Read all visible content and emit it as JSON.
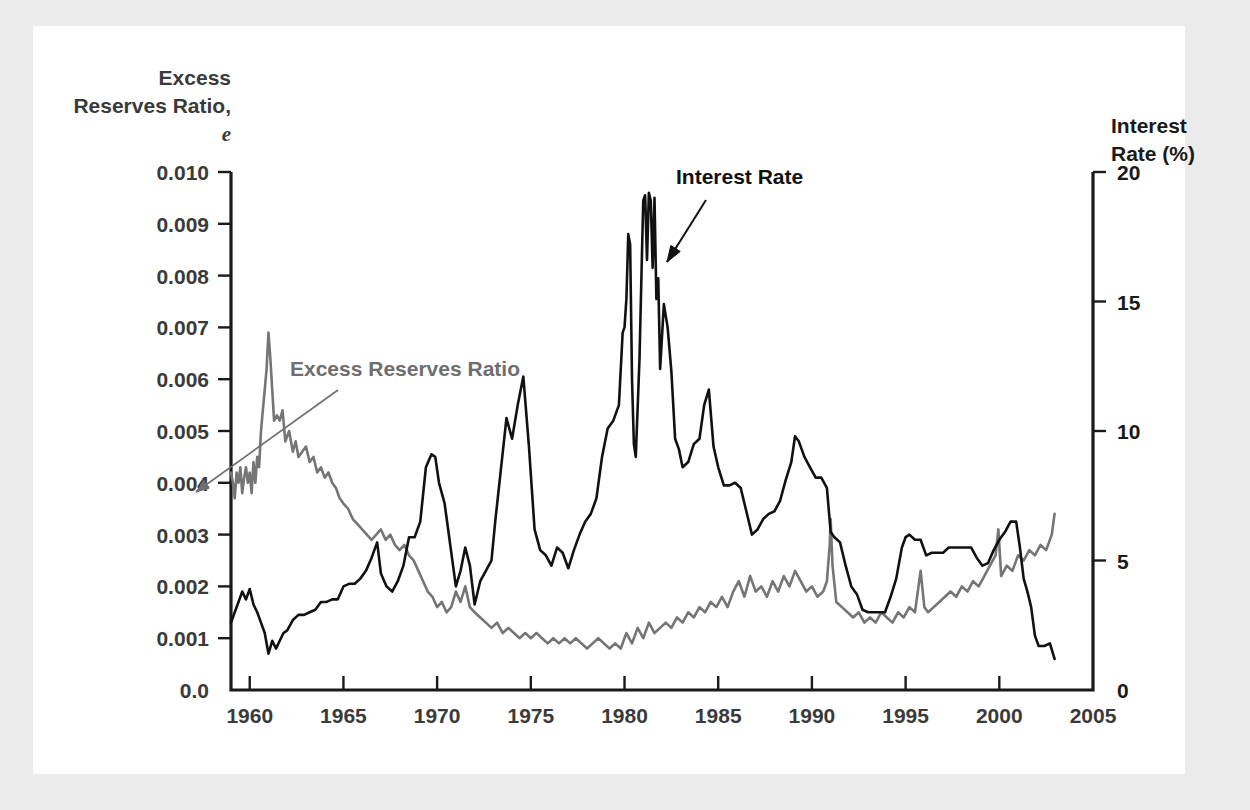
{
  "figure": {
    "background_color": "#ebebeb",
    "panel_color": "#ffffff"
  },
  "chart_data": {
    "type": "line",
    "title": "",
    "subtitle": "",
    "xlabel": "",
    "ylabel": "Excess Reserves Ratio, e",
    "ylabel_line1": "Excess",
    "ylabel_line2": "Reserves Ratio,",
    "ylabel_line3_italic": "e",
    "y2label": "Interest Rate (%)",
    "y2label_line1": "Interest",
    "y2label_line2": "Rate (%)",
    "grid": false,
    "legend_position": "inline-annotations",
    "xlim": [
      1959,
      2005
    ],
    "ylim": [
      0.0,
      0.01
    ],
    "y2lim": [
      0,
      20
    ],
    "xticks": [
      1960,
      1965,
      1970,
      1975,
      1980,
      1985,
      1990,
      1995,
      2000,
      2005
    ],
    "xtick_labels": [
      "1960",
      "1965",
      "1970",
      "1975",
      "1980",
      "1985",
      "1990",
      "1995",
      "2000",
      "2005"
    ],
    "yticks": [
      0.0,
      0.001,
      0.002,
      0.003,
      0.004,
      0.005,
      0.006,
      0.007,
      0.008,
      0.009,
      0.01
    ],
    "ytick_labels": [
      "0.0",
      "0.001",
      "0.002",
      "0.003",
      "0.004",
      "0.005",
      "0.006",
      "0.007",
      "0.008",
      "0.009",
      "0.010"
    ],
    "y2ticks": [
      0,
      5,
      10,
      15,
      20
    ],
    "y2tick_labels": [
      "0",
      "5",
      "10",
      "15",
      "20"
    ],
    "annotations": [
      {
        "text": "Excess Reserves Ratio",
        "color": "#6e6e6e",
        "text_x": 290,
        "text_y": 376,
        "arrow_from": [
          338,
          390
        ],
        "arrow_to": [
          196,
          492
        ]
      },
      {
        "text": "Interest Rate",
        "color": "#111111",
        "text_x": 676,
        "text_y": 184,
        "arrow_from": [
          706,
          200
        ],
        "arrow_to": [
          667,
          262
        ]
      }
    ],
    "series": [
      {
        "name": "Excess Reserves Ratio",
        "axis": "left",
        "color": "#757575",
        "x": [
          1959.0,
          1959.1,
          1959.2,
          1959.3,
          1959.4,
          1959.5,
          1959.6,
          1959.7,
          1959.8,
          1959.9,
          1960.0,
          1960.1,
          1960.2,
          1960.3,
          1960.4,
          1960.5,
          1960.6,
          1960.75,
          1960.9,
          1961.0,
          1961.1,
          1961.2,
          1961.3,
          1961.45,
          1961.6,
          1961.75,
          1961.9,
          1962.1,
          1962.3,
          1962.45,
          1962.6,
          1962.8,
          1963.0,
          1963.2,
          1963.4,
          1963.6,
          1963.8,
          1964.0,
          1964.2,
          1964.4,
          1964.6,
          1964.8,
          1965.0,
          1965.25,
          1965.5,
          1965.75,
          1966.0,
          1966.25,
          1966.5,
          1966.75,
          1967.0,
          1967.25,
          1967.5,
          1967.75,
          1968.0,
          1968.25,
          1968.5,
          1968.75,
          1969.0,
          1969.25,
          1969.5,
          1969.75,
          1970.0,
          1970.25,
          1970.5,
          1970.75,
          1971.0,
          1971.25,
          1971.5,
          1971.75,
          1972.0,
          1972.3,
          1972.6,
          1972.9,
          1973.2,
          1973.5,
          1973.8,
          1974.1,
          1974.4,
          1974.7,
          1975.0,
          1975.3,
          1975.6,
          1975.9,
          1976.2,
          1976.5,
          1976.8,
          1977.1,
          1977.4,
          1977.7,
          1978.0,
          1978.3,
          1978.6,
          1978.9,
          1979.2,
          1979.5,
          1979.8,
          1980.1,
          1980.4,
          1980.7,
          1981.0,
          1981.3,
          1981.6,
          1981.9,
          1982.2,
          1982.5,
          1982.8,
          1983.1,
          1983.4,
          1983.7,
          1984.0,
          1984.3,
          1984.6,
          1984.9,
          1985.2,
          1985.5,
          1985.8,
          1986.1,
          1986.4,
          1986.7,
          1987.0,
          1987.3,
          1987.6,
          1987.9,
          1988.2,
          1988.5,
          1988.8,
          1989.1,
          1989.4,
          1989.7,
          1990.0,
          1990.3,
          1990.6,
          1990.8,
          1990.95,
          1991.0,
          1991.1,
          1991.3,
          1991.6,
          1991.9,
          1992.2,
          1992.5,
          1992.8,
          1993.1,
          1993.4,
          1993.7,
          1994.0,
          1994.3,
          1994.6,
          1994.9,
          1995.2,
          1995.5,
          1995.8,
          1996.0,
          1996.2,
          1996.5,
          1996.8,
          1997.1,
          1997.4,
          1997.7,
          1998.0,
          1998.3,
          1998.6,
          1998.9,
          1999.2,
          1999.5,
          1999.8,
          1999.95,
          2000.1,
          2000.4,
          2000.7,
          2001.0,
          2001.3,
          2001.6,
          2001.9,
          2002.2,
          2002.5,
          2002.8,
          2002.95
        ],
        "y": [
          0.0042,
          0.004,
          0.0037,
          0.0042,
          0.004,
          0.0043,
          0.0038,
          0.0041,
          0.0043,
          0.004,
          0.0042,
          0.0038,
          0.0044,
          0.004,
          0.0045,
          0.0043,
          0.005,
          0.0056,
          0.0062,
          0.0069,
          0.0064,
          0.0058,
          0.0052,
          0.0053,
          0.0052,
          0.0054,
          0.0048,
          0.005,
          0.0046,
          0.0048,
          0.0045,
          0.0046,
          0.0047,
          0.0044,
          0.0045,
          0.0042,
          0.0043,
          0.0041,
          0.0042,
          0.004,
          0.0039,
          0.0037,
          0.0036,
          0.0035,
          0.0033,
          0.0032,
          0.0031,
          0.003,
          0.0029,
          0.003,
          0.0031,
          0.0029,
          0.003,
          0.0028,
          0.0027,
          0.0028,
          0.0026,
          0.0025,
          0.0023,
          0.0021,
          0.0019,
          0.0018,
          0.0016,
          0.0017,
          0.0015,
          0.0016,
          0.0019,
          0.0017,
          0.002,
          0.0016,
          0.0015,
          0.0014,
          0.0013,
          0.0012,
          0.0013,
          0.0011,
          0.0012,
          0.0011,
          0.001,
          0.0011,
          0.001,
          0.0011,
          0.001,
          0.0009,
          0.001,
          0.0009,
          0.001,
          0.0009,
          0.001,
          0.0009,
          0.0008,
          0.0009,
          0.001,
          0.0009,
          0.0008,
          0.0009,
          0.0008,
          0.0011,
          0.0009,
          0.0012,
          0.001,
          0.0013,
          0.0011,
          0.0012,
          0.0013,
          0.0012,
          0.0014,
          0.0013,
          0.0015,
          0.0014,
          0.0016,
          0.0015,
          0.0017,
          0.0016,
          0.0018,
          0.0016,
          0.0019,
          0.0021,
          0.0018,
          0.0022,
          0.0019,
          0.002,
          0.0018,
          0.0021,
          0.0019,
          0.0022,
          0.002,
          0.0023,
          0.0021,
          0.0019,
          0.002,
          0.0018,
          0.0019,
          0.0021,
          0.0028,
          0.0033,
          0.0024,
          0.0017,
          0.0016,
          0.0015,
          0.0014,
          0.0015,
          0.0013,
          0.0014,
          0.0013,
          0.0015,
          0.0014,
          0.0013,
          0.0015,
          0.0014,
          0.0016,
          0.0015,
          0.0023,
          0.0016,
          0.0015,
          0.0016,
          0.0017,
          0.0018,
          0.0019,
          0.0018,
          0.002,
          0.0019,
          0.0021,
          0.002,
          0.0022,
          0.0024,
          0.0026,
          0.0031,
          0.0022,
          0.0024,
          0.0023,
          0.0026,
          0.0025,
          0.0027,
          0.0026,
          0.0028,
          0.0027,
          0.003,
          0.0034
        ]
      },
      {
        "name": "Interest Rate",
        "axis": "right",
        "color": "#111111",
        "x": [
          1959.0,
          1959.2,
          1959.4,
          1959.6,
          1959.8,
          1960.0,
          1960.2,
          1960.4,
          1960.6,
          1960.8,
          1961.0,
          1961.2,
          1961.4,
          1961.6,
          1961.8,
          1962.0,
          1962.3,
          1962.6,
          1962.9,
          1963.2,
          1963.5,
          1963.8,
          1964.1,
          1964.4,
          1964.7,
          1965.0,
          1965.3,
          1965.6,
          1965.9,
          1966.2,
          1966.5,
          1966.8,
          1967.0,
          1967.3,
          1967.6,
          1967.9,
          1968.2,
          1968.5,
          1968.8,
          1969.1,
          1969.4,
          1969.7,
          1969.9,
          1970.1,
          1970.4,
          1970.7,
          1971.0,
          1971.25,
          1971.5,
          1971.75,
          1972.0,
          1972.3,
          1972.6,
          1972.9,
          1973.1,
          1973.4,
          1973.7,
          1974.0,
          1974.3,
          1974.6,
          1974.9,
          1975.2,
          1975.5,
          1975.8,
          1976.1,
          1976.4,
          1976.7,
          1977.0,
          1977.3,
          1977.6,
          1977.9,
          1978.2,
          1978.5,
          1978.8,
          1979.1,
          1979.4,
          1979.7,
          1979.9,
          1980.0,
          1980.1,
          1980.2,
          1980.3,
          1980.4,
          1980.5,
          1980.6,
          1980.7,
          1980.8,
          1980.9,
          1981.0,
          1981.1,
          1981.2,
          1981.3,
          1981.4,
          1981.5,
          1981.6,
          1981.7,
          1981.8,
          1981.9,
          1982.1,
          1982.3,
          1982.5,
          1982.7,
          1982.9,
          1983.1,
          1983.4,
          1983.7,
          1984.0,
          1984.25,
          1984.5,
          1984.75,
          1985.0,
          1985.3,
          1985.6,
          1985.9,
          1986.2,
          1986.5,
          1986.8,
          1987.1,
          1987.4,
          1987.7,
          1988.0,
          1988.3,
          1988.6,
          1988.9,
          1989.1,
          1989.3,
          1989.6,
          1989.9,
          1990.2,
          1990.5,
          1990.8,
          1991.0,
          1991.2,
          1991.5,
          1991.8,
          1992.1,
          1992.4,
          1992.7,
          1993.0,
          1993.3,
          1993.6,
          1993.9,
          1994.2,
          1994.5,
          1994.8,
          1995.0,
          1995.2,
          1995.5,
          1995.8,
          1996.1,
          1996.4,
          1996.7,
          1997.0,
          1997.3,
          1997.6,
          1997.9,
          1998.2,
          1998.5,
          1998.8,
          1999.1,
          1999.4,
          1999.7,
          2000.0,
          2000.3,
          2000.6,
          2000.9,
          2001.1,
          2001.3,
          2001.5,
          2001.7,
          2001.9,
          2002.1,
          2002.4,
          2002.7,
          2002.95
        ],
        "y": [
          2.6,
          3.0,
          3.4,
          3.8,
          3.5,
          3.9,
          3.3,
          3.0,
          2.6,
          2.2,
          1.4,
          1.9,
          1.6,
          1.9,
          2.2,
          2.3,
          2.7,
          2.9,
          2.9,
          3.0,
          3.1,
          3.4,
          3.4,
          3.5,
          3.5,
          4.0,
          4.1,
          4.1,
          4.3,
          4.6,
          5.1,
          5.7,
          4.5,
          4.0,
          3.8,
          4.2,
          4.8,
          5.9,
          5.9,
          6.5,
          8.6,
          9.1,
          9.0,
          8.0,
          7.2,
          5.6,
          4.0,
          4.6,
          5.5,
          4.8,
          3.3,
          4.2,
          4.6,
          5.0,
          6.5,
          8.5,
          10.5,
          9.7,
          11.0,
          12.1,
          9.4,
          6.2,
          5.4,
          5.2,
          4.8,
          5.5,
          5.3,
          4.7,
          5.4,
          6.0,
          6.5,
          6.8,
          7.4,
          9.0,
          10.1,
          10.4,
          11.0,
          13.8,
          14.0,
          15.1,
          17.6,
          17.2,
          12.0,
          9.5,
          9.0,
          10.9,
          12.8,
          15.9,
          18.9,
          19.1,
          16.6,
          19.2,
          18.9,
          16.3,
          19.0,
          15.1,
          15.9,
          12.4,
          14.9,
          14.0,
          12.3,
          9.7,
          9.3,
          8.6,
          8.8,
          9.5,
          9.7,
          11.0,
          11.6,
          9.4,
          8.6,
          7.9,
          7.9,
          8.0,
          7.8,
          6.9,
          6.0,
          6.2,
          6.6,
          6.8,
          6.9,
          7.3,
          8.1,
          8.8,
          9.8,
          9.6,
          9.0,
          8.6,
          8.2,
          8.2,
          7.8,
          6.1,
          5.9,
          5.7,
          4.8,
          4.0,
          3.7,
          3.1,
          3.0,
          3.0,
          3.0,
          3.0,
          3.6,
          4.3,
          5.5,
          5.9,
          6.0,
          5.8,
          5.8,
          5.2,
          5.3,
          5.3,
          5.3,
          5.5,
          5.5,
          5.5,
          5.5,
          5.5,
          5.1,
          4.8,
          4.9,
          5.4,
          5.8,
          6.1,
          6.5,
          6.5,
          5.5,
          4.3,
          3.8,
          3.2,
          2.1,
          1.7,
          1.7,
          1.8,
          1.2
        ]
      }
    ]
  }
}
